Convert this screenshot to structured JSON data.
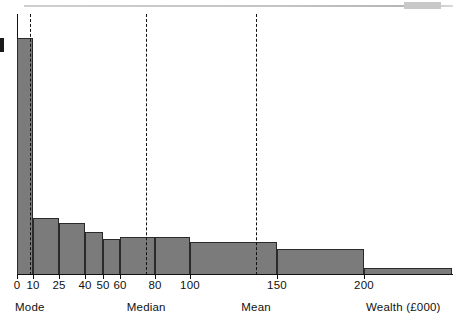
{
  "chart_data": {
    "type": "bar",
    "title": "",
    "subtitle": "",
    "xlabel": "Wealth (£000)",
    "ylabel": "",
    "grid": false,
    "legend": "none",
    "note": "Histogram of wealth with unequal class widths; frequency density plotted on the vertical axis. Vertical dashed reference lines mark the Mode, Median and Mean of the distribution.",
    "xlim": [
      0,
      250
    ],
    "ylim": [
      0,
      100
    ],
    "x_tick_values": [
      0,
      10,
      25,
      40,
      50,
      60,
      80,
      100,
      150,
      200
    ],
    "x_tick_labels": [
      "0",
      "10",
      "25",
      "40",
      "50",
      "60",
      "80",
      "100",
      "150",
      "200"
    ],
    "categories": [
      "0-10",
      "10-25",
      "25-40",
      "40-50",
      "50-60",
      "60-80",
      "80-100",
      "100-150",
      "150-200",
      "200+"
    ],
    "bins": [
      {
        "label": "0-10",
        "x0": 0,
        "x1": 10,
        "density": 100
      },
      {
        "label": "10-25",
        "x0": 10,
        "x1": 25,
        "density": 24
      },
      {
        "label": "25-40",
        "x0": 25,
        "x1": 40,
        "density": 22
      },
      {
        "label": "40-50",
        "x0": 40,
        "x1": 50,
        "density": 18
      },
      {
        "label": "50-60",
        "x0": 50,
        "x1": 60,
        "density": 15
      },
      {
        "label": "60-80",
        "x0": 60,
        "x1": 80,
        "density": 16
      },
      {
        "label": "80-100",
        "x0": 80,
        "x1": 100,
        "density": 16
      },
      {
        "label": "100-150",
        "x0": 100,
        "x1": 150,
        "density": 14
      },
      {
        "label": "150-200",
        "x0": 150,
        "x1": 200,
        "density": 11
      },
      {
        "label": "200+",
        "x0": 200,
        "x1": 250,
        "density": 3
      }
    ],
    "values": [
      100,
      24,
      22,
      18,
      15,
      16,
      16,
      14,
      11,
      3
    ],
    "reference_lines": [
      {
        "name": "Mode",
        "label": "Mode",
        "value": 8,
        "style": "dashed"
      },
      {
        "name": "Median",
        "label": "Median",
        "value": 75,
        "style": "dashed"
      },
      {
        "name": "Mean",
        "label": "Mean",
        "value": 138,
        "style": "dashed"
      }
    ],
    "colors": {
      "bar_fill": "#7b7b7b",
      "bar_edge": "#2a2a2a",
      "axis": "#111111",
      "refline": "#111111",
      "background": "#ffffff"
    }
  }
}
